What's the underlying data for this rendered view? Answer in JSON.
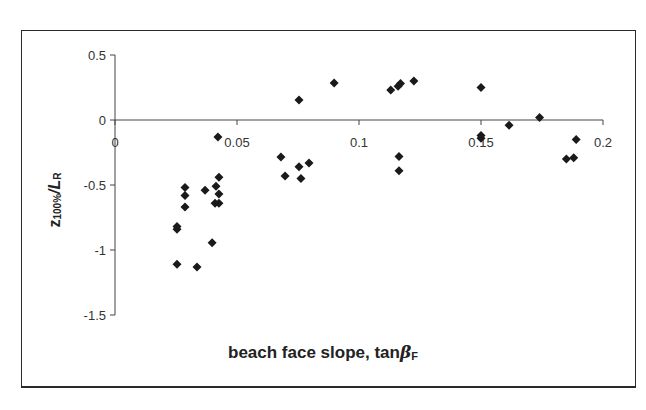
{
  "chart_data": {
    "type": "scatter",
    "title": "",
    "xlabel": "beach face slope, tanβ F",
    "ylabel": "z 100%/L R",
    "xlabel_parts": {
      "text": "beach face slope, tan",
      "symbol": "β",
      "subscript": "F"
    },
    "ylabel_parts": {
      "var": "z",
      "sub1": "100%",
      "mid": "/L",
      "sub2": "R"
    },
    "xlim": [
      0,
      0.2
    ],
    "ylim": [
      -1.5,
      0.5
    ],
    "x_ticks": [
      "0",
      "0.05",
      "0.1",
      "0.15",
      "0.2"
    ],
    "y_ticks": [
      "0.5",
      "0",
      "-0.5",
      "-1",
      "-1.5"
    ],
    "grid": false,
    "legend": null,
    "marker": "diamond",
    "marker_color": "#1a1a1a",
    "series": [
      {
        "name": "data",
        "points": [
          [
            0.0254,
            -0.82
          ],
          [
            0.0254,
            -0.84
          ],
          [
            0.0254,
            -1.11
          ],
          [
            0.0287,
            -0.52
          ],
          [
            0.0287,
            -0.58
          ],
          [
            0.0287,
            -0.67
          ],
          [
            0.0336,
            -1.13
          ],
          [
            0.0369,
            -0.54
          ],
          [
            0.0398,
            -0.945
          ],
          [
            0.041,
            -0.64
          ],
          [
            0.0414,
            -0.51
          ],
          [
            0.0422,
            -0.13
          ],
          [
            0.0426,
            -0.44
          ],
          [
            0.0426,
            -0.57
          ],
          [
            0.0426,
            -0.64
          ],
          [
            0.068,
            -0.285
          ],
          [
            0.0697,
            -0.43
          ],
          [
            0.0754,
            0.154
          ],
          [
            0.0754,
            -0.36
          ],
          [
            0.0762,
            -0.45
          ],
          [
            0.0795,
            -0.33
          ],
          [
            0.0898,
            0.285
          ],
          [
            0.113,
            0.23
          ],
          [
            0.116,
            0.26
          ],
          [
            0.117,
            0.28
          ],
          [
            0.1164,
            -0.28
          ],
          [
            0.1164,
            -0.39
          ],
          [
            0.1225,
            0.3
          ],
          [
            0.15,
            0.25
          ],
          [
            0.15,
            -0.12
          ],
          [
            0.15,
            -0.14
          ],
          [
            0.1615,
            -0.04
          ],
          [
            0.174,
            0.02
          ],
          [
            0.185,
            -0.3
          ],
          [
            0.188,
            -0.29
          ],
          [
            0.189,
            -0.15
          ]
        ]
      }
    ]
  }
}
